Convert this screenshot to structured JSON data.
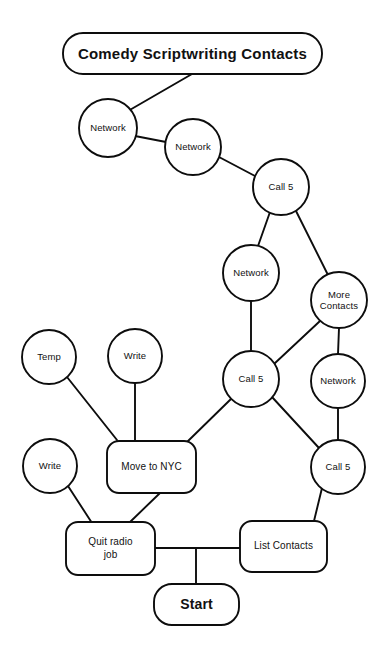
{
  "diagram": {
    "title": "Comedy Scriptwriting Contacts",
    "style": {
      "background": "#ffffff",
      "stroke": "#0d0d0d",
      "text": "#111111"
    },
    "nodes": [
      {
        "id": "title",
        "label": "Comedy Scriptwriting Contacts",
        "shape": "rounded-rect",
        "x": 63,
        "y": 33,
        "w": 259,
        "h": 41,
        "r": 20,
        "emphasis": "title"
      },
      {
        "id": "network-top-1",
        "label": "Network",
        "shape": "circle",
        "cx": 108,
        "cy": 128,
        "rad": 29
      },
      {
        "id": "network-top-2",
        "label": "Network",
        "shape": "circle",
        "cx": 193,
        "cy": 147,
        "rad": 28
      },
      {
        "id": "call5-top",
        "label": "Call 5",
        "shape": "circle",
        "cx": 281,
        "cy": 187,
        "rad": 28
      },
      {
        "id": "network-mid",
        "label": "Network",
        "shape": "circle",
        "cx": 251,
        "cy": 273,
        "rad": 28
      },
      {
        "id": "more-contacts",
        "label": "More\nContacts",
        "shape": "circle",
        "cx": 339,
        "cy": 300,
        "rad": 28
      },
      {
        "id": "temp",
        "label": "Temp",
        "shape": "circle",
        "cx": 49,
        "cy": 357,
        "rad": 27
      },
      {
        "id": "write-upper",
        "label": "Write",
        "shape": "circle",
        "cx": 135,
        "cy": 356,
        "rad": 27
      },
      {
        "id": "call5-mid",
        "label": "Call 5",
        "shape": "circle",
        "cx": 251,
        "cy": 379,
        "rad": 28
      },
      {
        "id": "network-right",
        "label": "Network",
        "shape": "circle",
        "cx": 338,
        "cy": 381,
        "rad": 27
      },
      {
        "id": "write-lower",
        "label": "Write",
        "shape": "circle",
        "cx": 50,
        "cy": 466,
        "rad": 27
      },
      {
        "id": "move-to-nyc",
        "label": "Move to NYC",
        "shape": "rounded-rect",
        "x": 107,
        "y": 441,
        "w": 89,
        "h": 52,
        "r": 12
      },
      {
        "id": "call5-bottom",
        "label": "Call 5",
        "shape": "circle",
        "cx": 338,
        "cy": 467,
        "rad": 27
      },
      {
        "id": "quit-radio-job",
        "label": "Quit radio\njob",
        "shape": "rounded-rect",
        "x": 66,
        "y": 522,
        "w": 89,
        "h": 53,
        "r": 12
      },
      {
        "id": "list-contacts",
        "label": "List Contacts",
        "shape": "rounded-rect",
        "x": 240,
        "y": 521,
        "w": 87,
        "h": 51,
        "r": 12
      },
      {
        "id": "start",
        "label": "Start",
        "shape": "rounded-rect",
        "x": 154,
        "y": 584,
        "w": 85,
        "h": 41,
        "r": 18,
        "emphasis": "start"
      }
    ],
    "edges": [
      {
        "id": "edge-title-network1",
        "from": "title",
        "to": "network-top-1",
        "points": "192,74 128,111"
      },
      {
        "id": "edge-network1-network2",
        "from": "network-top-1",
        "to": "network-top-2",
        "points": "135,136 166,142"
      },
      {
        "id": "edge-network2-call5top",
        "from": "network-top-2",
        "to": "call5-top",
        "points": "219,157 255,176"
      },
      {
        "id": "edge-call5top-networkmid",
        "from": "call5-top",
        "to": "network-mid",
        "points": "270,212 258,246"
      },
      {
        "id": "edge-call5top-morecontacts",
        "from": "call5-top",
        "to": "more-contacts",
        "points": "296,211 328,275"
      },
      {
        "id": "edge-networkmid-call5mid",
        "from": "network-mid",
        "to": "call5-mid",
        "points": "251,301 251,351"
      },
      {
        "id": "edge-morecontacts-call5mid",
        "from": "more-contacts",
        "to": "call5-mid",
        "points": "320,321 274,364"
      },
      {
        "id": "edge-morecontacts-networkright",
        "from": "more-contacts",
        "to": "network-right",
        "points": "339,328 338,354"
      },
      {
        "id": "edge-networkright-call5bottom",
        "from": "network-right",
        "to": "call5-bottom",
        "points": "338,408 338,440"
      },
      {
        "id": "edge-call5mid-movetonyc",
        "from": "call5-mid",
        "to": "move-to-nyc",
        "points": "232,398 186,443"
      },
      {
        "id": "edge-call5mid-call5bottom",
        "from": "call5-mid",
        "to": "call5-bottom",
        "points": "272,397 319,448"
      },
      {
        "id": "edge-temp-movetonyc",
        "from": "temp",
        "to": "move-to-nyc",
        "points": "67,377 117,440"
      },
      {
        "id": "edge-writeupper-movetonyc",
        "from": "write-upper",
        "to": "move-to-nyc",
        "points": "135,383 135,441"
      },
      {
        "id": "edge-writelower-quitradio",
        "from": "write-lower",
        "to": "quit-radio-job",
        "points": "68,486 92,523"
      },
      {
        "id": "edge-movetonyc-quitradio",
        "from": "move-to-nyc",
        "to": "quit-radio-job",
        "points": "160,493 129,523"
      },
      {
        "id": "edge-call5bottom-listcontacts",
        "from": "call5-bottom",
        "to": "list-contacts",
        "points": "322,488 314,521"
      },
      {
        "id": "edge-quitradio-listcontacts",
        "from": "quit-radio-job",
        "to": "list-contacts",
        "points": "155,548 240,548"
      },
      {
        "id": "edge-junction-start",
        "from": "quit-radio-job",
        "to": "start",
        "points": "196,548 196,584"
      }
    ]
  }
}
